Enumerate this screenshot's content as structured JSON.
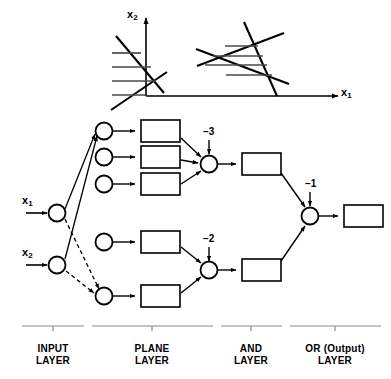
{
  "figure": {
    "type": "neural-network-diagram",
    "title": ""
  },
  "plot": {
    "x_axis_label": "x",
    "x_axis_sub": "1",
    "y_axis_label": "x",
    "y_axis_sub": "2",
    "description": "Two decision regions in the x1-x2 plane: an open hatched half-plane region at left crossed by the axes, and a closed hatched triangular region at right formed by three intersecting lines."
  },
  "inputs": [
    {
      "label": "x",
      "sub": "1",
      "name": "input-node-x1"
    },
    {
      "label": "x",
      "sub": "2",
      "name": "input-node-x2"
    }
  ],
  "biases": {
    "and_top": "–3",
    "and_bottom": "–2",
    "or_output": "–1"
  },
  "layers": [
    {
      "line1": "INPUT",
      "line2": "LAYER"
    },
    {
      "line1": "PLANE",
      "line2": "LAYER"
    },
    {
      "line1": "AND",
      "line2": "LAYER"
    },
    {
      "line1": "OR (Output)",
      "line2": "LAYER"
    }
  ],
  "colors": {
    "stroke": "#000000",
    "background": "#ffffff",
    "hatch": "#555555"
  },
  "counts": {
    "plane_nodes_top": 3,
    "plane_nodes_bottom": 2,
    "and_nodes": 2,
    "or_nodes": 1
  }
}
